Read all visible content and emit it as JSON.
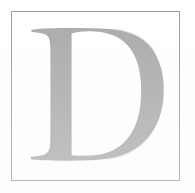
{
  "image": {
    "kind": "scanned-drop-cap",
    "letter": "D",
    "alt_text": "Large serif capital letter D in light gray inside a thin rectangular border",
    "width": 195,
    "height": 193
  },
  "colors": {
    "background": "#ffffff",
    "border": "#9b9b9b",
    "glyph": "#a9a9a9",
    "glyph_shadow": "#b4b4b4"
  },
  "border": {
    "name": "plate-border",
    "left": 11,
    "top": 11,
    "width": 169,
    "height": 170,
    "stroke_width": 1
  },
  "glyph": {
    "character": "D",
    "style": "roman-serif-capital",
    "left": 30,
    "top": 29,
    "right": 164,
    "bottom": 161,
    "stem_width": 22,
    "fill": "#a9a9a9"
  }
}
